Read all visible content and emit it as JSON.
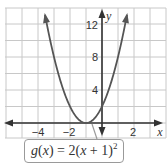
{
  "chart_data": {
    "type": "line",
    "title": "",
    "function_label": "g(x) = 2(x + 1)²",
    "function": "2*(x+1)^2",
    "vertex": [
      -1,
      0
    ],
    "xlabel": "x",
    "ylabel": "y",
    "xlim": [
      -6,
      4
    ],
    "ylim": [
      -1.8,
      14
    ],
    "x_ticks_labeled": [
      -4,
      -2,
      2
    ],
    "y_ticks_labeled": [
      4,
      8,
      12
    ],
    "x_grid_step": 1,
    "y_grid_step": 2,
    "grid": true,
    "series": [
      {
        "name": "g(x) = 2(x + 1)²",
        "x": [
          -3.6,
          -3,
          -2.5,
          -2,
          -1.5,
          -1,
          -0.5,
          0,
          0.5,
          1,
          1.6
        ],
        "y": [
          13.52,
          8,
          4.5,
          2,
          0.5,
          0,
          0.5,
          2,
          4.5,
          8,
          13.52
        ]
      }
    ],
    "colors": {
      "curve": "#555555",
      "grid": "#c8c8c8",
      "axis": "#333333"
    }
  },
  "labels": {
    "x_axis": "x",
    "y_axis": "y",
    "xticks": [
      "−4",
      "−2",
      "2"
    ],
    "yticks": [
      "4",
      "8",
      "12"
    ],
    "callout": {
      "g": "g",
      "x1": "x",
      "eq": " = 2(",
      "x2": "x",
      "rest": " + 1)",
      "exp": "2"
    }
  }
}
